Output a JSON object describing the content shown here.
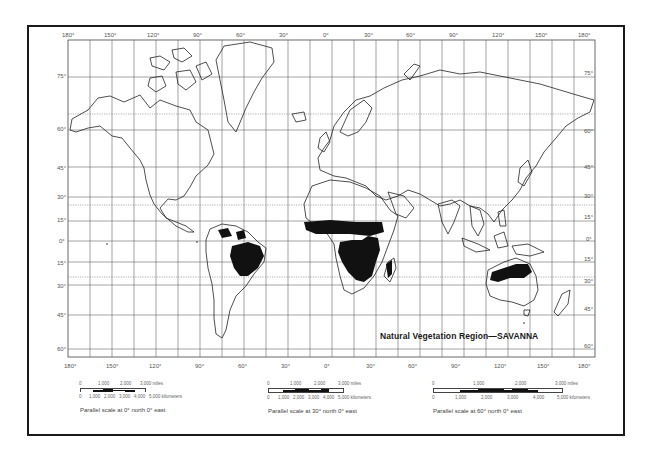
{
  "map": {
    "title": "Natural Vegetation Region—SAVANNA",
    "top_longitudes": [
      "180°",
      "150°",
      "120°",
      "90°",
      "60°",
      "30°",
      "0°",
      "30°",
      "60°",
      "90°",
      "120°",
      "150°",
      "180°"
    ],
    "bottom_longitudes": [
      "180°",
      "150°",
      "120°",
      "90°",
      "60°",
      "30°",
      "0°",
      "30°",
      "60°",
      "90°",
      "120°",
      "150°",
      "180°"
    ],
    "left_latitudes": [
      "75°",
      "60°",
      "45°",
      "30°",
      "15°",
      "0°",
      "15°",
      "30°",
      "45°",
      "60°"
    ],
    "right_latitudes": [
      "75°",
      "60°",
      "45°",
      "30°",
      "15°",
      "0°",
      "15°",
      "30°",
      "45°",
      "60°"
    ],
    "highlight_color": "#111111",
    "savanna_regions": [
      "South America (Brazil, Llanos)",
      "Sub-Saharan Africa (Sahel belt, East & Southern Africa)",
      "Madagascar",
      "Northern Australia"
    ]
  },
  "scales": [
    {
      "miles_ticks": [
        "0",
        "1,000",
        "2,000",
        "3,000 miles"
      ],
      "km_ticks": [
        "0",
        "1,000",
        "2,000",
        "3,000",
        "4,000",
        "5,000 kilometers"
      ],
      "caption": "Parallel scale at 0° north 0° east"
    },
    {
      "miles_ticks": [
        "0",
        "1,000",
        "2,000",
        "3,000 miles"
      ],
      "km_ticks": [
        "0",
        "1,000",
        "2,000",
        "3,000",
        "4,000",
        "5,000 kilometers"
      ],
      "caption": "Parallel scale at 30° north 0° east"
    },
    {
      "miles_ticks": [
        "0",
        "1,000",
        "2,000",
        "3,000 miles"
      ],
      "km_ticks": [
        "0",
        "1,000",
        "2,000",
        "3,000",
        "4,000",
        "5,000 kilometers"
      ],
      "caption": "Parallel scale at 60° north 0° east"
    }
  ]
}
